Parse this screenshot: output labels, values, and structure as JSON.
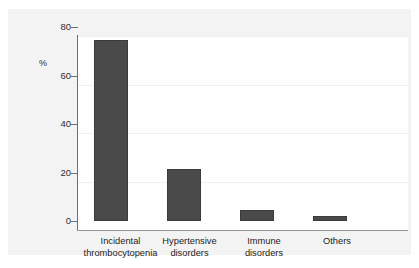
{
  "chart_data": {
    "type": "bar",
    "title": "",
    "subtitle": "",
    "xlabel": "",
    "ylabel": "%",
    "ylim": [
      0,
      80
    ],
    "yticks": [
      "0",
      "20",
      "40",
      "60",
      "80"
    ],
    "ytick_values": [
      0,
      20,
      40,
      60,
      80
    ],
    "grid": true,
    "legend": "none",
    "categories": [
      "Incidental thrombocytopenia",
      "Hypertensive disorders",
      "Immune disorders",
      "Others"
    ],
    "category_lines": [
      [
        "Incidental",
        "thrombocytopenia"
      ],
      [
        "Hypertensive",
        "disorders"
      ],
      [
        "Immune",
        "disorders"
      ],
      [
        "Others"
      ]
    ],
    "values": [
      74.8,
      21.5,
      4.5,
      2.0
    ],
    "bar_color": "#4a4a4a",
    "bar_border_color": "#3b3b3b",
    "axis_color": "#6f6f6f",
    "grid_color": "#f0f0f0",
    "panel_background": "#f3f3f3",
    "plot_background": "#fefefe"
  }
}
